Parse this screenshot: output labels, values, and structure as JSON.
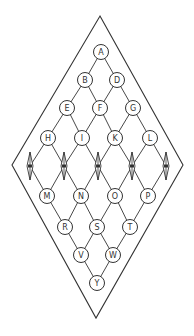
{
  "diagram": {
    "type": "lattice-diamond",
    "stroke_color": "#333333",
    "background": "#ffffff",
    "outline": {
      "top": [
        100,
        16
      ],
      "right": [
        183,
        165
      ],
      "bottom": [
        96,
        318
      ],
      "left": [
        12,
        165
      ]
    },
    "node_radius": 7.5,
    "nodes": [
      {
        "id": "A",
        "label": "A",
        "x": 101,
        "y": 52
      },
      {
        "id": "B",
        "label": "B",
        "x": 85,
        "y": 80
      },
      {
        "id": "D",
        "label": "D",
        "x": 117,
        "y": 80
      },
      {
        "id": "E",
        "label": "E",
        "x": 67,
        "y": 108
      },
      {
        "id": "F",
        "label": "F",
        "x": 100,
        "y": 108
      },
      {
        "id": "G",
        "label": "G",
        "x": 133,
        "y": 108
      },
      {
        "id": "H",
        "label": "H",
        "x": 48,
        "y": 138
      },
      {
        "id": "I",
        "label": "I",
        "x": 82,
        "y": 138
      },
      {
        "id": "K",
        "label": "K",
        "x": 115,
        "y": 138
      },
      {
        "id": "L",
        "label": "L",
        "x": 150,
        "y": 138
      },
      {
        "id": "M",
        "label": "M",
        "x": 47,
        "y": 196
      },
      {
        "id": "N",
        "label": "N",
        "x": 81,
        "y": 196
      },
      {
        "id": "O",
        "label": "O",
        "x": 115,
        "y": 196
      },
      {
        "id": "P",
        "label": "P",
        "x": 148,
        "y": 196
      },
      {
        "id": "R",
        "label": "R",
        "x": 65,
        "y": 227
      },
      {
        "id": "S",
        "label": "S",
        "x": 97,
        "y": 227
      },
      {
        "id": "T",
        "label": "T",
        "x": 130,
        "y": 227
      },
      {
        "id": "V",
        "label": "V",
        "x": 81,
        "y": 255
      },
      {
        "id": "W",
        "label": "W",
        "x": 113,
        "y": 255
      },
      {
        "id": "Y",
        "label": "Y",
        "x": 97,
        "y": 283
      }
    ],
    "markers": [
      {
        "id": "m1",
        "x": 30,
        "y": 166
      },
      {
        "id": "m2",
        "x": 64,
        "y": 166
      },
      {
        "id": "m3",
        "x": 98,
        "y": 166
      },
      {
        "id": "m4",
        "x": 132,
        "y": 166
      },
      {
        "id": "m5",
        "x": 166,
        "y": 166
      }
    ],
    "edges": [
      [
        "A",
        "B"
      ],
      [
        "A",
        "D"
      ],
      [
        "B",
        "E"
      ],
      [
        "B",
        "F"
      ],
      [
        "D",
        "F"
      ],
      [
        "D",
        "G"
      ],
      [
        "E",
        "H"
      ],
      [
        "E",
        "I"
      ],
      [
        "F",
        "I"
      ],
      [
        "F",
        "K"
      ],
      [
        "G",
        "K"
      ],
      [
        "G",
        "L"
      ],
      [
        "H",
        "m1"
      ],
      [
        "H",
        "m2"
      ],
      [
        "I",
        "m2"
      ],
      [
        "I",
        "m3"
      ],
      [
        "K",
        "m3"
      ],
      [
        "K",
        "m4"
      ],
      [
        "L",
        "m4"
      ],
      [
        "L",
        "m5"
      ],
      [
        "m1",
        "M"
      ],
      [
        "m2",
        "M"
      ],
      [
        "m2",
        "N"
      ],
      [
        "m3",
        "N"
      ],
      [
        "m3",
        "O"
      ],
      [
        "m4",
        "O"
      ],
      [
        "m4",
        "P"
      ],
      [
        "m5",
        "P"
      ],
      [
        "M",
        "R"
      ],
      [
        "N",
        "R"
      ],
      [
        "N",
        "S"
      ],
      [
        "O",
        "S"
      ],
      [
        "O",
        "T"
      ],
      [
        "P",
        "T"
      ],
      [
        "R",
        "V"
      ],
      [
        "S",
        "V"
      ],
      [
        "S",
        "W"
      ],
      [
        "T",
        "W"
      ],
      [
        "V",
        "Y"
      ],
      [
        "W",
        "Y"
      ]
    ]
  }
}
